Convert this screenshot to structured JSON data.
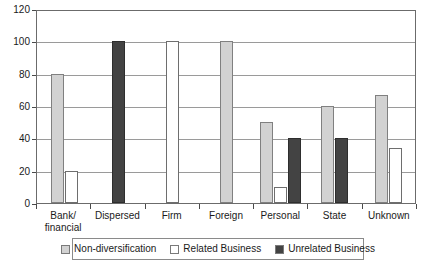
{
  "chart_data": {
    "type": "bar",
    "title": "",
    "subtitle": "",
    "xlabel": "",
    "ylabel": "",
    "ylim": [
      0,
      120
    ],
    "ytick_step": 20,
    "yticks": [
      120,
      100,
      80,
      60,
      40,
      20,
      0
    ],
    "grid": true,
    "legend_position": "bottom",
    "categories": [
      "Bank/\nfinancial",
      "Dispersed",
      "Firm",
      "Foreign",
      "Personal",
      "State",
      "Unknown"
    ],
    "category_lines": [
      [
        "Bank/",
        "financial"
      ],
      [
        "Dispersed"
      ],
      [
        "Firm"
      ],
      [
        "Foreign"
      ],
      [
        "Personal"
      ],
      [
        "State"
      ],
      [
        "Unknown"
      ]
    ],
    "series": [
      {
        "name": "Non-diversification",
        "color": "#d2d2d2",
        "values": [
          80,
          0,
          0,
          100,
          50,
          60,
          67
        ]
      },
      {
        "name": "Related Business",
        "color": "#ffffff",
        "values": [
          20,
          0,
          100,
          0,
          10,
          0,
          34
        ]
      },
      {
        "name": "Unrelated Business",
        "color": "#434343",
        "values": [
          0,
          100,
          0,
          0,
          40,
          40,
          0
        ]
      }
    ]
  },
  "legend": {
    "items": [
      {
        "label": "Non-diversification"
      },
      {
        "label": "Related Business"
      },
      {
        "label": "Unrelated Business"
      }
    ]
  },
  "axis": {
    "y": {
      "ticks": [
        {
          "label": "120"
        },
        {
          "label": "100"
        },
        {
          "label": "80"
        },
        {
          "label": "60"
        },
        {
          "label": "40"
        },
        {
          "label": "20"
        },
        {
          "label": "0"
        }
      ]
    }
  }
}
